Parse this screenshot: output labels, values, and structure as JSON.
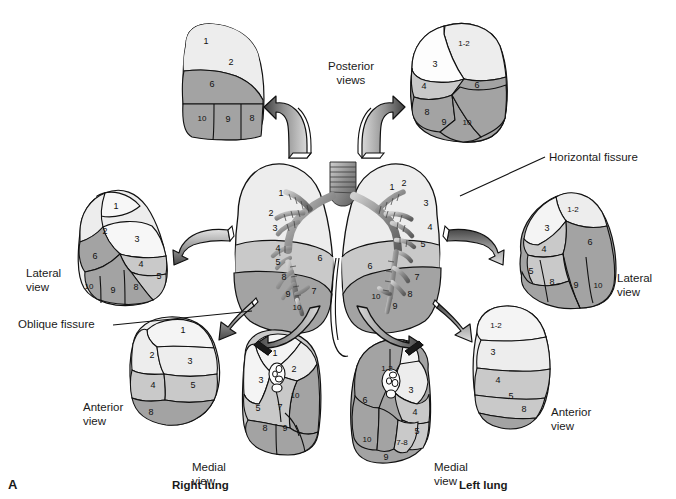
{
  "figure": {
    "panel_letter": "A",
    "title_labels": {
      "posterior_views": "Posterior\nviews",
      "horizontal_fissure": "Horizontal fissure",
      "oblique_fissure": "Oblique fissure",
      "right_lung": "Right lung",
      "left_lung": "Left lung"
    },
    "view_labels": {
      "right_lateral": "Lateral\nview",
      "right_anterior": "Anterior\nview",
      "right_medial": "Medial\nview",
      "left_lateral": "Lateral\nview",
      "left_anterior": "Anterior\nview",
      "left_medial": "Medial\nview"
    }
  },
  "colors": {
    "light": "#ededed",
    "lighter": "#f4f4f4",
    "medium": "#c9c9c9",
    "dark": "#a3a3a3",
    "outline": "#111111",
    "white": "#fdfdfd",
    "arrow_dark": "#4d4d4d",
    "arrow_mid": "#8c8c8c",
    "arrow_light": "#d9d9d9",
    "text": "#1a1a1a"
  },
  "views": {
    "right_posterior": {
      "name": "Right lung posterior view",
      "segments": [
        "1",
        "2",
        "6",
        "10",
        "9",
        "8"
      ]
    },
    "left_posterior": {
      "name": "Left lung posterior view",
      "segments": [
        "1-2",
        "3",
        "4",
        "6",
        "8",
        "9",
        "10"
      ]
    },
    "right_lateral": {
      "name": "Right lung lateral view",
      "segments": [
        "1",
        "2",
        "3",
        "6",
        "4",
        "5",
        "10",
        "9",
        "8"
      ]
    },
    "left_lateral": {
      "name": "Left lung lateral view",
      "segments": [
        "1-2",
        "3",
        "4",
        "6",
        "5",
        "8",
        "9",
        "10"
      ]
    },
    "right_anterior": {
      "name": "Right lung anterior view",
      "segments": [
        "1",
        "2",
        "3",
        "4",
        "5",
        "8"
      ]
    },
    "left_anterior": {
      "name": "Left lung anterior view",
      "segments": [
        "1-2",
        "3",
        "4",
        "5",
        "8"
      ]
    },
    "right_medial": {
      "name": "Right lung medial view",
      "segments": [
        "1",
        "2",
        "3",
        "10",
        "5",
        "7",
        "8",
        "9"
      ]
    },
    "left_medial": {
      "name": "Left lung medial view",
      "segments": [
        "1-2",
        "3",
        "4",
        "5",
        "6",
        "10",
        "7-8",
        "9"
      ]
    },
    "central_right": {
      "name": "Right lung with bronchial tree",
      "segments": [
        "1",
        "2",
        "3",
        "4",
        "5",
        "6",
        "8",
        "9",
        "10",
        "7"
      ]
    },
    "central_left": {
      "name": "Left lung with bronchial tree",
      "segments": [
        "1",
        "2",
        "3",
        "4",
        "5",
        "6",
        "7",
        "8",
        "9",
        "10"
      ]
    }
  },
  "segment_numbers": {
    "right_posterior": [
      {
        "t": "1",
        "x": 206,
        "y": 41
      },
      {
        "t": "2",
        "x": 231,
        "y": 62
      },
      {
        "t": "6",
        "x": 212,
        "y": 84
      },
      {
        "t": "10",
        "x": 202,
        "y": 118
      },
      {
        "t": "9",
        "x": 228,
        "y": 119
      },
      {
        "t": "8",
        "x": 252,
        "y": 118
      }
    ],
    "left_posterior": [
      {
        "t": "1-2",
        "x": 464,
        "y": 43
      },
      {
        "t": "3",
        "x": 435,
        "y": 64
      },
      {
        "t": "4",
        "x": 424,
        "y": 86
      },
      {
        "t": "6",
        "x": 477,
        "y": 85
      },
      {
        "t": "8",
        "x": 427,
        "y": 112
      },
      {
        "t": "9",
        "x": 444,
        "y": 122
      },
      {
        "t": "10",
        "x": 467,
        "y": 122
      }
    ],
    "right_lateral": [
      {
        "t": "1",
        "x": 116,
        "y": 206
      },
      {
        "t": "2",
        "x": 105,
        "y": 231
      },
      {
        "t": "3",
        "x": 137,
        "y": 239
      },
      {
        "t": "6",
        "x": 95,
        "y": 256
      },
      {
        "t": "4",
        "x": 141,
        "y": 264
      },
      {
        "t": "5",
        "x": 159,
        "y": 276
      },
      {
        "t": "10",
        "x": 89,
        "y": 286
      },
      {
        "t": "9",
        "x": 113,
        "y": 290
      },
      {
        "t": "8",
        "x": 136,
        "y": 287
      }
    ],
    "left_lateral": [
      {
        "t": "1-2",
        "x": 573,
        "y": 209
      },
      {
        "t": "3",
        "x": 547,
        "y": 228
      },
      {
        "t": "4",
        "x": 544,
        "y": 249
      },
      {
        "t": "6",
        "x": 590,
        "y": 242
      },
      {
        "t": "5",
        "x": 531,
        "y": 271
      },
      {
        "t": "8",
        "x": 552,
        "y": 282
      },
      {
        "t": "9",
        "x": 576,
        "y": 285
      },
      {
        "t": "10",
        "x": 598,
        "y": 285
      }
    ],
    "right_anterior": [
      {
        "t": "1",
        "x": 183,
        "y": 330
      },
      {
        "t": "2",
        "x": 152,
        "y": 355
      },
      {
        "t": "3",
        "x": 190,
        "y": 361
      },
      {
        "t": "4",
        "x": 153,
        "y": 385
      },
      {
        "t": "5",
        "x": 193,
        "y": 385
      },
      {
        "t": "8",
        "x": 151,
        "y": 412
      }
    ],
    "left_anterior": [
      {
        "t": "1-2",
        "x": 496,
        "y": 325
      },
      {
        "t": "3",
        "x": 493,
        "y": 352
      },
      {
        "t": "4",
        "x": 498,
        "y": 380
      },
      {
        "t": "5",
        "x": 511,
        "y": 396
      },
      {
        "t": "8",
        "x": 524,
        "y": 409
      }
    ],
    "right_medial": [
      {
        "t": "1",
        "x": 275,
        "y": 353
      },
      {
        "t": "2",
        "x": 294,
        "y": 369
      },
      {
        "t": "3",
        "x": 261,
        "y": 380
      },
      {
        "t": "10",
        "x": 295,
        "y": 395
      },
      {
        "t": "5",
        "x": 258,
        "y": 408
      },
      {
        "t": "7",
        "x": 280,
        "y": 407
      },
      {
        "t": "8",
        "x": 265,
        "y": 428
      },
      {
        "t": "9",
        "x": 285,
        "y": 428
      }
    ],
    "left_medial": [
      {
        "t": "1-2",
        "x": 387,
        "y": 368
      },
      {
        "t": "3",
        "x": 411,
        "y": 390
      },
      {
        "t": "4",
        "x": 415,
        "y": 412
      },
      {
        "t": "6",
        "x": 365,
        "y": 400
      },
      {
        "t": "5",
        "x": 417,
        "y": 431
      },
      {
        "t": "10",
        "x": 367,
        "y": 439
      },
      {
        "t": "7-8",
        "x": 402,
        "y": 442
      },
      {
        "t": "9",
        "x": 386,
        "y": 457
      }
    ],
    "central_right": [
      {
        "t": "1",
        "x": 281,
        "y": 193
      },
      {
        "t": "2",
        "x": 271,
        "y": 213
      },
      {
        "t": "3",
        "x": 275,
        "y": 228
      },
      {
        "t": "4",
        "x": 278,
        "y": 248
      },
      {
        "t": "5",
        "x": 278,
        "y": 262
      },
      {
        "t": "6",
        "x": 320,
        "y": 258
      },
      {
        "t": "8",
        "x": 284,
        "y": 277
      },
      {
        "t": "9",
        "x": 288,
        "y": 294
      },
      {
        "t": "10",
        "x": 297,
        "y": 307
      },
      {
        "t": "7",
        "x": 314,
        "y": 291
      }
    ],
    "central_left": [
      {
        "t": "1",
        "x": 392,
        "y": 187
      },
      {
        "t": "2",
        "x": 404,
        "y": 183
      },
      {
        "t": "3",
        "x": 426,
        "y": 203
      },
      {
        "t": "4",
        "x": 430,
        "y": 227
      },
      {
        "t": "5",
        "x": 423,
        "y": 244
      },
      {
        "t": "6",
        "x": 370,
        "y": 266
      },
      {
        "t": "7",
        "x": 417,
        "y": 277
      },
      {
        "t": "8",
        "x": 410,
        "y": 294
      },
      {
        "t": "9",
        "x": 395,
        "y": 306
      },
      {
        "t": "10",
        "x": 376,
        "y": 296
      }
    ]
  }
}
